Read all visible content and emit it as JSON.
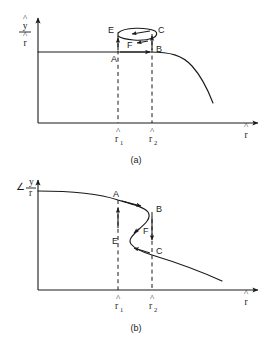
{
  "figure": {
    "type": "diagram",
    "background_color": "#ffffff",
    "line_color": "#1a1a1a"
  },
  "panels": [
    {
      "id": "a",
      "caption": "(a)",
      "y_axis": {
        "label_numerator": "y",
        "label_denominator": "r",
        "numerator_hat": "^",
        "denominator_hat": "^",
        "label_plain": "ŷ/r̂"
      },
      "x_axis": {
        "label": "r",
        "label_hat": "^",
        "label_plain": "r̂"
      },
      "ticks": [
        {
          "name": "r1",
          "base": "r",
          "subscript": "1",
          "plain": "r̂1"
        },
        {
          "name": "r2",
          "base": "r",
          "subscript": "2",
          "plain": "r̂2"
        }
      ],
      "points": [
        {
          "label": "A",
          "position": "lower-left of loop, on flat branch at r̂1"
        },
        {
          "label": "B",
          "position": "lower-right of loop, on flat branch at r̂2"
        },
        {
          "label": "C",
          "position": "upper-right of loop at r̂2"
        },
        {
          "label": "E",
          "position": "upper-left of loop at r̂1"
        },
        {
          "label": "F",
          "position": "middle of loop interior"
        }
      ],
      "arrows": [
        {
          "from": "A",
          "to": "E",
          "direction": "up"
        },
        {
          "from": "A",
          "to": "B",
          "direction": "right"
        },
        {
          "from": "B",
          "to": "C",
          "direction": "up"
        },
        {
          "from": "C",
          "to": "E",
          "direction": "left"
        }
      ]
    },
    {
      "id": "b",
      "caption": "(b)",
      "y_axis": {
        "angle_symbol": "∠",
        "label_numerator": "y",
        "label_denominator": "r",
        "label_plain": "∠ y/r"
      },
      "x_axis": {
        "label": "r",
        "label_hat": "^",
        "label_plain": "r̂"
      },
      "ticks": [
        {
          "name": "r1",
          "base": "r",
          "subscript": "1",
          "plain": "r̂1"
        },
        {
          "name": "r2",
          "base": "r",
          "subscript": "2",
          "plain": "r̂2"
        }
      ],
      "points": [
        {
          "label": "A",
          "position": "upper branch at r̂1"
        },
        {
          "label": "B",
          "position": "right fold of S-curve at r̂2"
        },
        {
          "label": "C",
          "position": "lower branch at r̂2"
        },
        {
          "label": "E",
          "position": "left fold of S-curve at r̂1"
        },
        {
          "label": "F",
          "position": "middle unstable branch"
        }
      ],
      "arrows": [
        {
          "from": "A",
          "to": "B",
          "direction": "right"
        },
        {
          "from": "B",
          "to": "C",
          "direction": "down"
        },
        {
          "from": "C",
          "to": "E",
          "direction": "left"
        },
        {
          "from": "E",
          "to": "A",
          "direction": "up"
        }
      ]
    }
  ]
}
